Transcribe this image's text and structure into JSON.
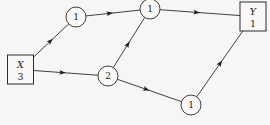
{
  "diagram": {
    "type": "directed-graph",
    "title": "",
    "background_color": "#f7f6f4",
    "line_color": "#2b2b2b",
    "nodes": [
      {
        "id": "source",
        "shape": "box",
        "label_top": "X",
        "label_bottom": "3",
        "x": 20.5,
        "y": 69.5,
        "width": 26,
        "height": 29
      },
      {
        "id": "n-upper-left",
        "shape": "circle",
        "label": "1",
        "x": 76,
        "y": 17,
        "r": 10
      },
      {
        "id": "n-top-middle",
        "shape": "circle",
        "label": "1",
        "x": 150,
        "y": 9,
        "r": 10
      },
      {
        "id": "n-lower-middle",
        "shape": "circle",
        "label": "2",
        "x": 108,
        "y": 76,
        "r": 10
      },
      {
        "id": "n-lower-right",
        "shape": "circle",
        "label": "1",
        "x": 191,
        "y": 105,
        "r": 10
      },
      {
        "id": "sink",
        "shape": "box",
        "label_top": "Y",
        "label_bottom": "1",
        "x": 253,
        "y": 16.5,
        "width": 26,
        "height": 29
      }
    ],
    "edges": [
      {
        "from": "source",
        "to": "n-upper-left",
        "arrow_position": 0.55
      },
      {
        "from": "n-upper-left",
        "to": "n-top-middle",
        "arrow_position": 0.5
      },
      {
        "from": "n-top-middle",
        "to": "sink",
        "arrow_position": 0.5
      },
      {
        "from": "source",
        "to": "n-lower-middle",
        "arrow_position": 0.5
      },
      {
        "from": "n-lower-middle",
        "to": "n-top-middle",
        "arrow_position": 0.52
      },
      {
        "from": "n-lower-middle",
        "to": "n-lower-right",
        "arrow_position": 0.5
      },
      {
        "from": "n-lower-right",
        "to": "sink",
        "arrow_position": 0.55
      }
    ]
  }
}
